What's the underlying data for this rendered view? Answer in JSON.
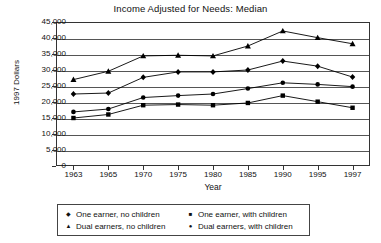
{
  "chart_data": {
    "type": "line",
    "title": "Income Adjusted for Needs: Median",
    "xlabel": "Year",
    "ylabel": "1997 Dollars",
    "categories": [
      "1963",
      "1965",
      "1970",
      "1975",
      "1980",
      "1985",
      "1990",
      "1995",
      "1997"
    ],
    "ylim": [
      0,
      45000
    ],
    "ytick_labels": [
      "45,000",
      "40,000",
      "35,000",
      "30,000",
      "25,000",
      "20,000",
      "15,000",
      "10,000",
      "5,000",
      "0"
    ],
    "ytick_values": [
      45000,
      40000,
      35000,
      30000,
      25000,
      20000,
      15000,
      10000,
      5000,
      0
    ],
    "grid": true,
    "legend_position": "bottom",
    "series": [
      {
        "name": "One earner, no children",
        "marker": "diamond",
        "color": "#000000",
        "values": [
          22500,
          22800,
          27700,
          29400,
          29400,
          30000,
          32800,
          31200,
          27800
        ]
      },
      {
        "name": "One earner, with children",
        "marker": "square",
        "color": "#000000",
        "values": [
          15000,
          16100,
          19000,
          19200,
          19000,
          19700,
          22000,
          20100,
          18200
        ]
      },
      {
        "name": "Dual earners, no children",
        "marker": "triangle",
        "color": "#000000",
        "values": [
          27000,
          29600,
          34400,
          34600,
          34400,
          37500,
          42200,
          40100,
          38200
        ]
      },
      {
        "name": "Dual earners, with children",
        "marker": "circle",
        "color": "#000000",
        "values": [
          16900,
          17800,
          21400,
          22000,
          22500,
          24200,
          26000,
          25500,
          24800
        ]
      }
    ]
  },
  "legend": {
    "entries": [
      {
        "marker": "diamond",
        "label": "One earner, no children"
      },
      {
        "marker": "square",
        "label": "One earner, with children"
      },
      {
        "marker": "triangle",
        "label": "Dual earners, no children"
      },
      {
        "marker": "circle",
        "label": "Dual earners, with children"
      }
    ]
  }
}
